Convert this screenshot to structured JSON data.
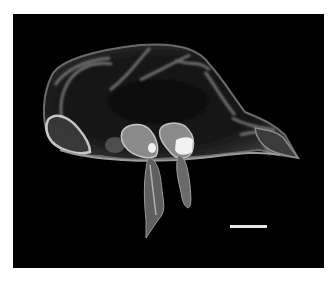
{
  "image": {
    "subject": "3D rendering of a translucent cell-like structure with appendages",
    "background_color": "#000000",
    "page_background": "#ffffff",
    "frame": {
      "x": 13,
      "y": 14,
      "width": 311,
      "height": 254
    }
  },
  "scale_bar": {
    "color": "#e6e6e6",
    "x": 230,
    "y": 225,
    "width": 37,
    "height": 3,
    "label": ""
  }
}
